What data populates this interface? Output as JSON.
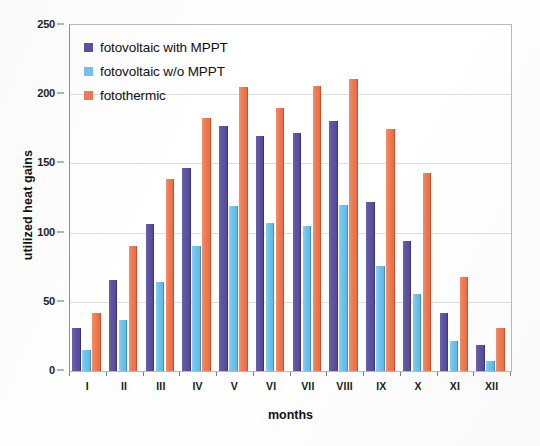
{
  "chart_data": {
    "type": "bar",
    "title": "",
    "xlabel": "months",
    "ylabel": "utilized heat gains",
    "categories": [
      "I",
      "II",
      "III",
      "IV",
      "V",
      "VI",
      "VII",
      "VIII",
      "IX",
      "X",
      "XI",
      "XII"
    ],
    "ylim": [
      0,
      250
    ],
    "yticks": [
      0,
      50,
      100,
      150,
      200,
      250
    ],
    "grid": true,
    "legend_position": "top-left",
    "series": [
      {
        "name": "fotovoltaic with MPPT",
        "color": "#5b52a0",
        "values": [
          31,
          66,
          106,
          147,
          177,
          170,
          172,
          181,
          122,
          94,
          42,
          19
        ]
      },
      {
        "name": "fotovoltaic w/o MPPT",
        "color": "#6ec5ee",
        "values": [
          15,
          37,
          64,
          90,
          119,
          107,
          105,
          120,
          76,
          56,
          22,
          7
        ]
      },
      {
        "name": "fotothermic",
        "color": "#f07a52",
        "values": [
          42,
          90,
          139,
          183,
          205,
          190,
          206,
          211,
          175,
          143,
          68,
          31
        ]
      }
    ]
  }
}
